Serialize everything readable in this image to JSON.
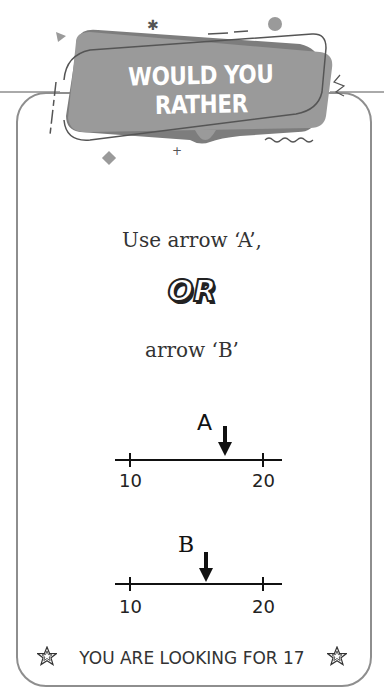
{
  "header": {
    "title": "WOULD YOU RATHER",
    "banner_color": "#9a9a9a"
  },
  "question": {
    "option_a_text": "Use arrow ‘A’,",
    "separator": "OR",
    "option_b_text": "arrow ‘B’"
  },
  "number_lines": [
    {
      "arrow_label": "A",
      "min_label": "10",
      "max_label": "20",
      "min": 10,
      "max": 20,
      "arrow_value": 17.1
    },
    {
      "arrow_label": "B",
      "min_label": "10",
      "max_label": "20",
      "min": 10,
      "max": 20,
      "arrow_value": 15.7
    }
  ],
  "footer": {
    "text": "YOU ARE LOOKING FOR 17",
    "left_icon": "star-icon",
    "right_icon": "star-icon"
  },
  "colors": {
    "card_border": "#8e8e8e",
    "text": "#333333"
  }
}
